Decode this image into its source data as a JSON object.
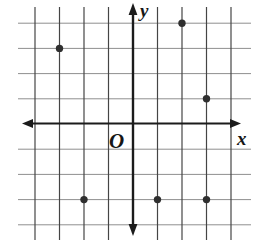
{
  "chart_data": {
    "type": "scatter",
    "title": "",
    "xlabel": "x",
    "ylabel": "y",
    "origin_label": "O",
    "points": [
      {
        "x": -3,
        "y": 3
      },
      {
        "x": 2,
        "y": 4
      },
      {
        "x": 3,
        "y": 1
      },
      {
        "x": -2,
        "y": -3
      },
      {
        "x": 1,
        "y": -3
      },
      {
        "x": 3,
        "y": -3
      }
    ],
    "xlim": [
      -4.5,
      4.4
    ],
    "ylim": [
      -4.6,
      4.8
    ],
    "grid": true,
    "grid_x_units": [
      -4,
      -3,
      -2,
      -1,
      1,
      2,
      3,
      4
    ],
    "grid_y_units": [
      -4,
      -3,
      -2,
      -1,
      1,
      2,
      3,
      4
    ],
    "legend_position": "none",
    "colors": {
      "background": "#ffffff",
      "grid_horizontal": "#8f8f8f",
      "grid_vertical": "#454545",
      "axis": "#1b1b1b",
      "point": "#2f2f2f",
      "label": "#161616"
    }
  }
}
